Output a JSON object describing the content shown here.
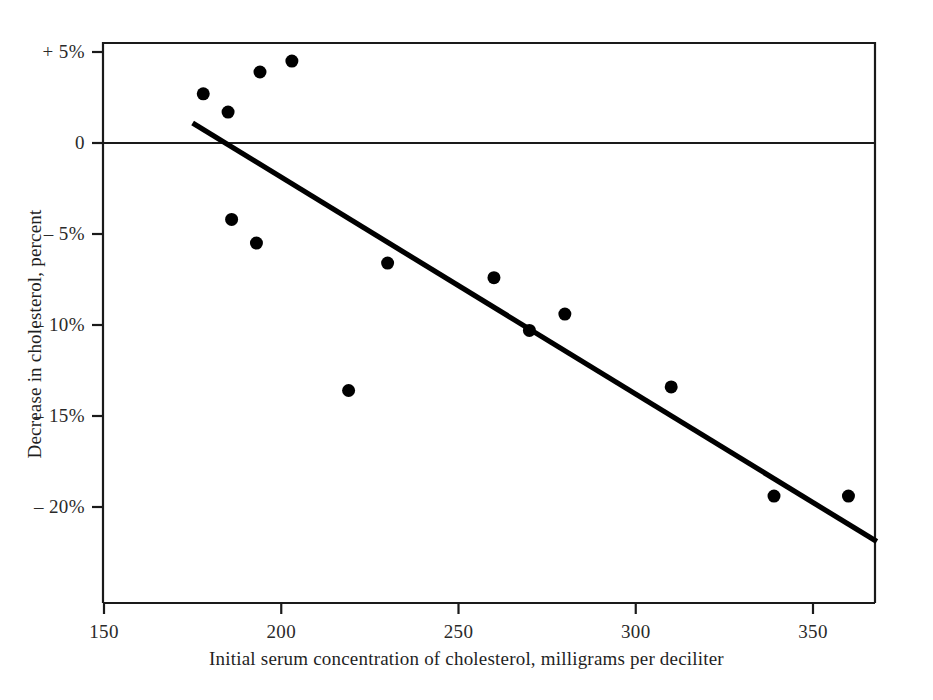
{
  "chart_data": {
    "type": "scatter",
    "title": "",
    "subtitle": "",
    "xlabel": "Initial serum concentration of cholesterol, milligrams per deciliter",
    "ylabel": "Decrease in cholesterol, percent",
    "xlim": [
      150,
      368
    ],
    "ylim": [
      -23,
      6
    ],
    "grid": false,
    "legend": "none",
    "xticks": [
      150,
      200,
      250,
      300,
      350
    ],
    "xtick_labels": [
      "150",
      "200",
      "250",
      "300",
      "350"
    ],
    "yticks": [
      5,
      0,
      -5,
      -10,
      -15,
      -20
    ],
    "ytick_labels": [
      "+ 5%",
      "0",
      "– 5%",
      "– 10%",
      "– 15%",
      "– 20%"
    ],
    "zero_reference_line": 0,
    "points": [
      {
        "x": 178,
        "y": 2.7
      },
      {
        "x": 185,
        "y": 1.7
      },
      {
        "x": 194,
        "y": 3.9
      },
      {
        "x": 203,
        "y": 4.5
      },
      {
        "x": 186,
        "y": -4.2
      },
      {
        "x": 193,
        "y": -5.5
      },
      {
        "x": 219,
        "y": -13.6
      },
      {
        "x": 230,
        "y": -6.6
      },
      {
        "x": 260,
        "y": -7.4
      },
      {
        "x": 270,
        "y": -10.3
      },
      {
        "x": 280,
        "y": -9.4
      },
      {
        "x": 310,
        "y": -13.4
      },
      {
        "x": 339,
        "y": -19.4
      },
      {
        "x": 360,
        "y": -19.4
      }
    ],
    "fit_line": {
      "name": "regression line",
      "x_start": 175,
      "y_start": 1.1,
      "x_end": 368,
      "y_end": -21.9
    },
    "marker": {
      "shape": "circle",
      "color": "#000000",
      "size_px": 13
    },
    "line_color": "#000000",
    "axis_color": "#1a1a1a",
    "background_color": "#ffffff"
  },
  "figure": {
    "frame": {
      "left": 103,
      "right": 875,
      "top": 43,
      "bottom": 603
    }
  }
}
